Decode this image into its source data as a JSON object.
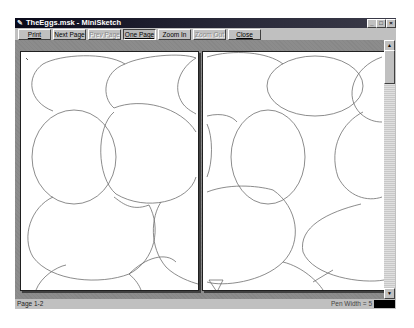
{
  "window": {
    "title": "TheEggs.msk - MiniSketch",
    "app_icon": "minisketch-app-icon",
    "controls": {
      "minimize": "_",
      "maximize": "□",
      "close": "×"
    }
  },
  "toolbar": {
    "buttons": [
      {
        "label": "Print",
        "state": "normal"
      },
      {
        "label": "Next Page",
        "state": "normal"
      },
      {
        "label": "Prev Page",
        "state": "disabled"
      },
      {
        "label": "One Page",
        "state": "pressed"
      },
      {
        "label": "Zoom In",
        "state": "normal"
      },
      {
        "label": "Zoom Out",
        "state": "disabled"
      },
      {
        "label": "Close",
        "state": "normal"
      }
    ]
  },
  "preview": {
    "pages": [
      {
        "label": "Page 1",
        "content": "egg-shape ellipse sketch"
      },
      {
        "label": "Page 2",
        "content": "egg-shape ellipse sketch"
      }
    ]
  },
  "scrollbar": {
    "up_arrow": "▲",
    "down_arrow": "▼"
  },
  "statusbar": {
    "pages": "Page 1-2",
    "pen_width": "Pen Width = 5",
    "pen_color": "#000000"
  },
  "colors": {
    "titlebar": "#0a0a1a",
    "face": "#c0c0c0",
    "workspace": "#8c8c8c",
    "paper": "#ffffff",
    "stroke": "#6e6e6e"
  }
}
